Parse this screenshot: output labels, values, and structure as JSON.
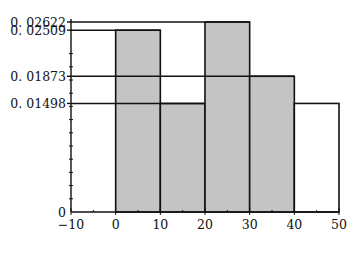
{
  "chart_data": {
    "type": "bar",
    "title": "",
    "xlabel": "",
    "ylabel": "",
    "xlim": [
      -10,
      50
    ],
    "ylim": [
      0,
      0.02622
    ],
    "grid": false,
    "legend": null,
    "bins": [
      {
        "x0": 0,
        "x1": 10,
        "value": 0.02509,
        "fill": "#c4c4c4"
      },
      {
        "x0": 10,
        "x1": 20,
        "value": 0.01498,
        "fill": "#c4c4c4"
      },
      {
        "x0": 20,
        "x1": 30,
        "value": 0.02622,
        "fill": "#c4c4c4"
      },
      {
        "x0": 30,
        "x1": 40,
        "value": 0.01873,
        "fill": "#c4c4c4"
      },
      {
        "x0": 40,
        "x1": 50,
        "value": 0.01498,
        "fill": "#ffffff"
      }
    ],
    "categories": [
      "0-10",
      "10-20",
      "20-30",
      "30-40",
      "40-50"
    ],
    "values": [
      0.02509,
      0.01498,
      0.02622,
      0.01873,
      0.01498
    ],
    "x_ticks": [
      "-10",
      "0",
      "10",
      "20",
      "30",
      "40",
      "50"
    ],
    "y_ticks": [
      "0",
      "0.01498",
      "0.01873",
      "0.02509",
      "0.02622"
    ],
    "reference_lines": [
      {
        "y": 0.02622,
        "label": "0.02622",
        "to_x": 30
      },
      {
        "y": 0.02509,
        "label": "0.02509",
        "to_x": 10
      },
      {
        "y": 0.01873,
        "label": "0.01873",
        "to_x": 40
      },
      {
        "y": 0.01498,
        "label": "0.01498",
        "to_x": 20
      }
    ]
  }
}
